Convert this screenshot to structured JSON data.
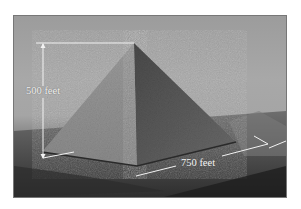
{
  "figure": {
    "colors": {
      "sky": "#a6a6a6",
      "pyramid_lit_face": "#8e8e8e",
      "pyramid_shadow_face": "#5a5a5a",
      "ground": "#3c3c3c",
      "annotation_line": "#f2f2f2"
    },
    "annotations": {
      "height_label": "500 feet",
      "base_label": "750 feet"
    }
  }
}
